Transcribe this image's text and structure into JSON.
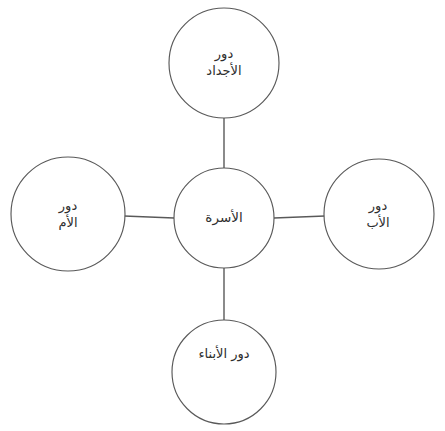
{
  "diagram": {
    "title": "الأسرة",
    "type": "hub-and-spoke",
    "background_color": "#ffffff",
    "stroke_color": "#595959",
    "text_color": "#2e2e2e",
    "center": {
      "id": "family",
      "label": "الأسرة",
      "lines": [
        "الأسرة"
      ],
      "cx": 224,
      "cy": 218,
      "r": 50
    },
    "nodes": [
      {
        "id": "grandparents",
        "label": "دور الأجداد",
        "lines": [
          "دور",
          "الأجداد"
        ],
        "position": "top",
        "cx": 224,
        "cy": 63,
        "r": 55
      },
      {
        "id": "father",
        "label": "دور الأب",
        "lines": [
          "دور",
          "الأب"
        ],
        "position": "right",
        "cx": 379,
        "cy": 214,
        "r": 55
      },
      {
        "id": "children",
        "label": "دور الأبناء",
        "lines": [
          "دور الأبناء"
        ],
        "position": "bottom",
        "cx": 224,
        "cy": 372,
        "r": 52
      },
      {
        "id": "mother",
        "label": "دور الأم",
        "lines": [
          "دور",
          "الأم"
        ],
        "position": "left",
        "cx": 68,
        "cy": 214,
        "r": 57
      }
    ],
    "connectors": [
      {
        "id": "center-to-grandparents",
        "from": "family",
        "to": "grandparents",
        "x1": 224,
        "y1": 168,
        "x2": 224,
        "y2": 118
      },
      {
        "id": "center-to-father",
        "from": "family",
        "to": "father",
        "x1": 274,
        "y1": 218,
        "x2": 324,
        "y2": 216
      },
      {
        "id": "center-to-children",
        "from": "family",
        "to": "children",
        "x1": 224,
        "y1": 268,
        "x2": 224,
        "y2": 320
      },
      {
        "id": "center-to-mother",
        "from": "family",
        "to": "mother",
        "x1": 174,
        "y1": 218,
        "x2": 125,
        "y2": 216
      }
    ]
  }
}
